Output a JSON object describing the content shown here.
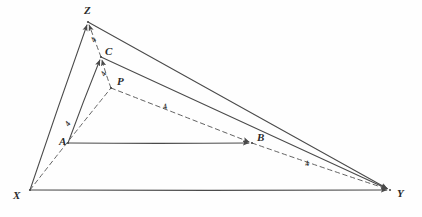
{
  "figure": {
    "type": "hand-drawn-geometry",
    "width": 422,
    "height": 217,
    "stroke_color": "#4a4a4a",
    "dash_color": "#5a5a5a",
    "background_color": "#fefefe",
    "vertices": [
      {
        "id": "Z",
        "label": "Z",
        "x": 88,
        "y": 22,
        "label_x": 84,
        "label_y": 5
      },
      {
        "id": "C",
        "label": "C",
        "x": 101,
        "y": 57,
        "label_x": 105,
        "label_y": 46
      },
      {
        "id": "P",
        "label": "P",
        "x": 111,
        "y": 88,
        "label_x": 117,
        "label_y": 76
      },
      {
        "id": "A",
        "label": "A",
        "x": 68,
        "y": 143,
        "label_x": 59,
        "label_y": 136
      },
      {
        "id": "B",
        "label": "B",
        "x": 252,
        "y": 143,
        "label_x": 257,
        "label_y": 132
      },
      {
        "id": "X",
        "label": "X",
        "x": 30,
        "y": 190,
        "label_x": 13,
        "label_y": 190
      },
      {
        "id": "Y",
        "label": "Y",
        "x": 390,
        "y": 190,
        "label_x": 397,
        "label_y": 188
      }
    ],
    "solid_edges": [
      {
        "name": "edge-x-z",
        "from": "X",
        "to": "Z"
      },
      {
        "name": "edge-z-y",
        "from": "Z",
        "to": "Y"
      },
      {
        "name": "edge-x-y",
        "from": "X",
        "to": "Y"
      },
      {
        "name": "edge-a-c",
        "from": "A",
        "to": "C"
      },
      {
        "name": "edge-c-y",
        "from": "C",
        "to": "Y"
      },
      {
        "name": "edge-a-b",
        "from": "A",
        "to": "B"
      }
    ],
    "dashed_edges": [
      {
        "name": "dashed-x-p",
        "from": "X",
        "to": "P"
      },
      {
        "name": "dashed-p-b",
        "from": "P",
        "to": "B"
      },
      {
        "name": "dashed-b-y",
        "from": "B",
        "to": "Y"
      },
      {
        "name": "dashed-p-c",
        "from": "P",
        "to": "C"
      },
      {
        "name": "dashed-c-z",
        "from": "C",
        "to": "Z"
      }
    ],
    "arrow_targets": [
      "Z",
      "C",
      "B",
      "Y"
    ],
    "segment_labels": [
      {
        "name": "label-zc",
        "text": "4",
        "x": 92,
        "y": 36,
        "rotation": -62
      },
      {
        "name": "label-cp",
        "text": "4",
        "x": 102,
        "y": 70,
        "rotation": -62
      },
      {
        "name": "label-pb",
        "text": "4",
        "x": 163,
        "y": 103,
        "rotation": -16
      },
      {
        "name": "label-xp",
        "text": "4",
        "x": 66,
        "y": 120,
        "rotation": -58
      },
      {
        "name": "label-by",
        "text": "4",
        "x": 305,
        "y": 160,
        "rotation": -16
      }
    ]
  }
}
